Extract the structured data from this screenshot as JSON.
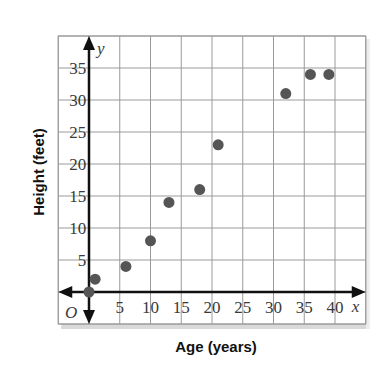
{
  "chart_data": {
    "type": "scatter",
    "title": "",
    "xlabel": "Age (years)",
    "ylabel": "Height (feet)",
    "x_axis_letter": "x",
    "y_axis_letter": "y",
    "origin_label": "O",
    "xlim": [
      -5,
      45
    ],
    "ylim": [
      -5,
      40
    ],
    "x_ticks": [
      5,
      10,
      15,
      20,
      25,
      30,
      35,
      40
    ],
    "y_ticks": [
      5,
      10,
      15,
      20,
      25,
      30,
      35
    ],
    "grid": true,
    "grid_step": 5,
    "points": [
      {
        "x": 0,
        "y": 0
      },
      {
        "x": 1,
        "y": 2
      },
      {
        "x": 6,
        "y": 4
      },
      {
        "x": 10,
        "y": 8
      },
      {
        "x": 13,
        "y": 14
      },
      {
        "x": 18,
        "y": 16
      },
      {
        "x": 21,
        "y": 23
      },
      {
        "x": 32,
        "y": 31
      },
      {
        "x": 36,
        "y": 34
      },
      {
        "x": 39,
        "y": 34
      }
    ],
    "colors": {
      "point": "#555555",
      "grid": "#9a9a9a",
      "axis": "#111111",
      "frame_shadow": "#d9d9d9"
    }
  }
}
